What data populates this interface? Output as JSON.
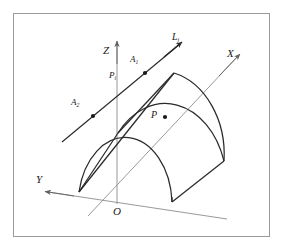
{
  "figure": {
    "type": "geometry-diagram",
    "frame_color": "#9a9a9a",
    "stroke_color": "#1a1a1a",
    "axis_color": "#8a8a8a",
    "background": "#ffffff"
  },
  "cutoff_text": {
    "fragment_a": "n",
    "fragment_b": "m"
  },
  "axes": [
    {
      "id": "z",
      "label": "Z",
      "subscript": "",
      "direction": "up"
    },
    {
      "id": "x",
      "label": "X",
      "subscript": "",
      "direction": "up-right"
    },
    {
      "id": "y",
      "label": "Y",
      "subscript": "",
      "direction": "down-left"
    }
  ],
  "origin": {
    "label": "O"
  },
  "line": {
    "label": "L",
    "subscript": "j"
  },
  "points": [
    {
      "id": "a1",
      "label": "A",
      "subscript": "1",
      "on": "line-L"
    },
    {
      "id": "a2",
      "label": "A",
      "subscript": "2",
      "on": "line-L"
    },
    {
      "id": "pi",
      "label": "P",
      "subscript": "i",
      "on": "z-axis"
    },
    {
      "id": "p",
      "label": "P",
      "subscript": "",
      "on": "vault-surface"
    }
  ]
}
